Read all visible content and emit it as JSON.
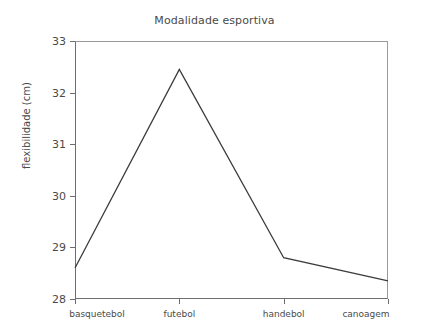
{
  "chart_data": {
    "type": "line",
    "title": "Modalidade esportiva",
    "xlabel": "",
    "ylabel": "flexibilidade (cm)",
    "categories": [
      "basquetebol",
      "futebol",
      "handebol",
      "canoagem"
    ],
    "values": [
      28.6,
      32.45,
      28.8,
      28.35
    ],
    "series": [
      {
        "name": "flexibilidade",
        "values": [
          28.6,
          32.45,
          28.8,
          28.35
        ]
      }
    ],
    "ylim": [
      28,
      33
    ],
    "yticks": [
      28,
      29,
      30,
      31,
      32,
      33
    ],
    "ytick_labels": [
      "28",
      "29",
      "30",
      "31",
      "32",
      "33"
    ],
    "grid": false,
    "legend": "none",
    "line_color": "#3c3c3c",
    "axis_color": "#6e6e6e",
    "background": "#ffffff"
  }
}
